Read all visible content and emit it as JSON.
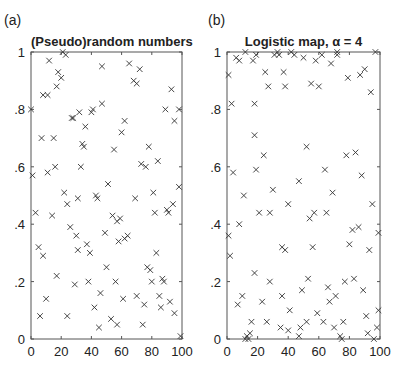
{
  "chart_data": [
    {
      "panel": "(a)",
      "type": "scatter",
      "title": "(Pseudo)random numbers",
      "xlabel": "",
      "ylabel": "",
      "xlim": [
        0,
        100
      ],
      "ylim": [
        0,
        1
      ],
      "xticks": [
        "0",
        "20",
        "40",
        "60",
        "80",
        "100"
      ],
      "yticks": [
        "0",
        ".2",
        ".4",
        ".6",
        ".8",
        "1"
      ],
      "grid": false,
      "marker": "x",
      "points": [
        [
          0,
          0.8
        ],
        [
          1,
          0.57
        ],
        [
          3,
          0.44
        ],
        [
          5,
          0.32
        ],
        [
          6,
          0.08
        ],
        [
          7,
          0.7
        ],
        [
          8,
          0.29
        ],
        [
          8,
          0.85
        ],
        [
          10,
          0.14
        ],
        [
          11,
          0.58
        ],
        [
          11,
          0.85
        ],
        [
          12,
          0.97
        ],
        [
          14,
          0.43
        ],
        [
          15,
          0.7
        ],
        [
          16,
          0.6
        ],
        [
          17,
          0.22
        ],
        [
          17,
          0.88
        ],
        [
          18,
          0.93
        ],
        [
          20,
          0.91
        ],
        [
          21,
          1.0
        ],
        [
          22,
          0.51
        ],
        [
          23,
          0.99
        ],
        [
          24,
          0.08
        ],
        [
          24,
          0.47
        ],
        [
          26,
          0.39
        ],
        [
          27,
          0.77
        ],
        [
          28,
          0.77
        ],
        [
          29,
          0.19
        ],
        [
          30,
          0.36
        ],
        [
          31,
          0.49
        ],
        [
          31,
          0.31
        ],
        [
          32,
          0.79
        ],
        [
          33,
          0.6
        ],
        [
          34,
          0.68
        ],
        [
          35,
          0.67
        ],
        [
          36,
          0.74
        ],
        [
          37,
          0.33
        ],
        [
          38,
          0.2
        ],
        [
          39,
          0.3
        ],
        [
          40,
          0.79
        ],
        [
          41,
          0.8
        ],
        [
          42,
          0.11
        ],
        [
          43,
          0.5
        ],
        [
          44,
          0.49
        ],
        [
          45,
          0.04
        ],
        [
          46,
          0.16
        ],
        [
          47,
          0.82
        ],
        [
          47,
          0.95
        ],
        [
          49,
          0.37
        ],
        [
          50,
          0.25
        ],
        [
          51,
          0.54
        ],
        [
          53,
          0.07
        ],
        [
          54,
          0.43
        ],
        [
          55,
          0.66
        ],
        [
          56,
          0.2
        ],
        [
          57,
          0.05
        ],
        [
          57,
          0.41
        ],
        [
          58,
          0.34
        ],
        [
          59,
          0.42
        ],
        [
          60,
          0.72
        ],
        [
          61,
          0.14
        ],
        [
          62,
          0.76
        ],
        [
          62,
          0.35
        ],
        [
          64,
          0.36
        ],
        [
          65,
          0.96
        ],
        [
          68,
          0.9
        ],
        [
          69,
          0.49
        ],
        [
          70,
          0.15
        ],
        [
          70,
          0.89
        ],
        [
          72,
          0.94
        ],
        [
          73,
          0.61
        ],
        [
          74,
          0.05
        ],
        [
          75,
          0.12
        ],
        [
          76,
          0.6
        ],
        [
          77,
          0.25
        ],
        [
          78,
          0.67
        ],
        [
          79,
          0.24
        ],
        [
          80,
          0.2
        ],
        [
          81,
          0.51
        ],
        [
          82,
          0.44
        ],
        [
          83,
          0.3
        ],
        [
          84,
          0.62
        ],
        [
          85,
          0.15
        ],
        [
          86,
          0.11
        ],
        [
          87,
          0.21
        ],
        [
          88,
          0.2
        ],
        [
          89,
          0.8
        ],
        [
          90,
          0.45
        ],
        [
          91,
          0.44
        ],
        [
          92,
          0.13
        ],
        [
          93,
          0.87
        ],
        [
          94,
          0.47
        ],
        [
          95,
          0.76
        ],
        [
          95,
          0.09
        ],
        [
          98,
          0.53
        ],
        [
          98,
          0.8
        ],
        [
          99,
          0.01
        ]
      ]
    },
    {
      "panel": "(b)",
      "type": "scatter",
      "title": "Logistic map, α = 4",
      "xlabel": "",
      "ylabel": "",
      "xlim": [
        0,
        100
      ],
      "ylim": [
        0,
        1
      ],
      "xticks": [
        "0",
        "20",
        "40",
        "60",
        "80",
        "100"
      ],
      "yticks": [
        "0",
        ".2",
        ".4",
        ".6",
        ".8",
        "1"
      ],
      "grid": false,
      "marker": "x",
      "points": [
        [
          1,
          0.92
        ],
        [
          1,
          0.36
        ],
        [
          2,
          0.29
        ],
        [
          3,
          0.82
        ],
        [
          4,
          0.58
        ],
        [
          6,
          0.98
        ],
        [
          7,
          0.12
        ],
        [
          8,
          0.97
        ],
        [
          8,
          0.4
        ],
        [
          10,
          0.15
        ],
        [
          11,
          0.5
        ],
        [
          12,
          1.0
        ],
        [
          12,
          0.0
        ],
        [
          13,
          0.01
        ],
        [
          14,
          0.0
        ],
        [
          15,
          0.02
        ],
        [
          16,
          0.06
        ],
        [
          17,
          0.97
        ],
        [
          18,
          0.82
        ],
        [
          18,
          0.71
        ],
        [
          18,
          0.23
        ],
        [
          19,
          0.59
        ],
        [
          19,
          0.99
        ],
        [
          21,
          0.44
        ],
        [
          23,
          0.13
        ],
        [
          24,
          0.64
        ],
        [
          25,
          0.93
        ],
        [
          26,
          0.06
        ],
        [
          27,
          0.88
        ],
        [
          28,
          0.2
        ],
        [
          28,
          0.44
        ],
        [
          30,
          0.52
        ],
        [
          31,
          0.99
        ],
        [
          33,
          1.0
        ],
        [
          34,
          0.99
        ],
        [
          35,
          0.04
        ],
        [
          36,
          0.15
        ],
        [
          36,
          0.32
        ],
        [
          37,
          0.93
        ],
        [
          38,
          0.88
        ],
        [
          38,
          0.31
        ],
        [
          40,
          0.47
        ],
        [
          40,
          0.03
        ],
        [
          41,
          0.1
        ],
        [
          42,
          1.0
        ],
        [
          44,
          0.99
        ],
        [
          47,
          0.55
        ],
        [
          47,
          0.01
        ],
        [
          48,
          0.04
        ],
        [
          49,
          0.17
        ],
        [
          50,
          0.98
        ],
        [
          52,
          0.67
        ],
        [
          52,
          0.06
        ],
        [
          53,
          0.21
        ],
        [
          54,
          0.42
        ],
        [
          55,
          0.89
        ],
        [
          56,
          0.32
        ],
        [
          57,
          0.44
        ],
        [
          58,
          0.97
        ],
        [
          59,
          0.09
        ],
        [
          60,
          0.88
        ],
        [
          62,
          0.99
        ],
        [
          63,
          0.06
        ],
        [
          64,
          0.59
        ],
        [
          65,
          0.44
        ],
        [
          66,
          0.18
        ],
        [
          67,
          0.13
        ],
        [
          68,
          0.96
        ],
        [
          69,
          0.51
        ],
        [
          70,
          0.04
        ],
        [
          71,
          0.15
        ],
        [
          72,
          0.99
        ],
        [
          72,
          1.0
        ],
        [
          74,
          0.01
        ],
        [
          75,
          0.0
        ],
        [
          76,
          0.06
        ],
        [
          77,
          0.2
        ],
        [
          78,
          0.64
        ],
        [
          79,
          0.91
        ],
        [
          80,
          0.33
        ],
        [
          82,
          0.38
        ],
        [
          83,
          0.21
        ],
        [
          84,
          0.65
        ],
        [
          86,
          0.39
        ],
        [
          87,
          0.92
        ],
        [
          88,
          0.57
        ],
        [
          89,
          0.17
        ],
        [
          90,
          0.94
        ],
        [
          91,
          0.08
        ],
        [
          92,
          0.02
        ],
        [
          93,
          0.31
        ],
        [
          94,
          0.86
        ],
        [
          95,
          0.47
        ],
        [
          96,
          0.0
        ],
        [
          97,
          1.0
        ],
        [
          98,
          0.04
        ],
        [
          99,
          0.1
        ],
        [
          99,
          0.37
        ]
      ]
    }
  ],
  "panels": {
    "a": {
      "label": "(a)",
      "title": "(Pseudo)random numbers"
    },
    "b": {
      "label": "(b)",
      "title": "Logistic map, α = 4"
    }
  }
}
